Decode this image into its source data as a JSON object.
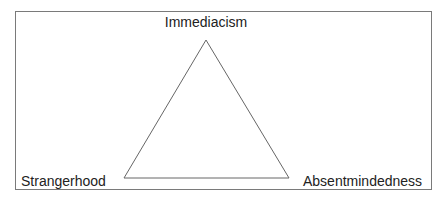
{
  "diagram": {
    "type": "triangle",
    "colors": {
      "frame": "#7a7a7a",
      "edges": "#666666",
      "text": "#222222",
      "background": "#ffffff"
    },
    "nodes": {
      "top": {
        "label": "Immediacism"
      },
      "bottom_left": {
        "label": "Strangerhood"
      },
      "bottom_right": {
        "label": "Absentmindedness"
      }
    },
    "edges": [
      {
        "from": "Immediacism",
        "to": "Strangerhood"
      },
      {
        "from": "Immediacism",
        "to": "Absentmindedness"
      },
      {
        "from": "Strangerhood",
        "to": "Absentmindedness"
      }
    ]
  }
}
